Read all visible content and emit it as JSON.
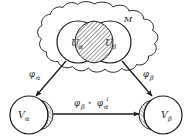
{
  "figure": {
    "background_color": "#ffffff",
    "stroke_color": "#1a1a1a",
    "hatch_color": "#555555"
  },
  "manifold": {
    "label": "M",
    "shape": "cloud"
  },
  "charts": {
    "u_alpha": {
      "label": "U",
      "subscript": "α"
    },
    "u_beta": {
      "label": "U",
      "subscript": "β"
    },
    "intersection": {
      "name": "u-alpha-beta-overlap",
      "fill": "hatched"
    }
  },
  "images": {
    "v_alpha": {
      "label": "V",
      "subscript": "α"
    },
    "v_beta": {
      "label": "V",
      "subscript": "β"
    }
  },
  "maps": {
    "phi_alpha": {
      "symbol": "φ",
      "subscript": "α"
    },
    "phi_beta": {
      "symbol": "φ",
      "subscript": "β"
    },
    "transition": {
      "first_symbol": "φ",
      "first_subscript": "β",
      "compose": "∘",
      "second_symbol": "φ",
      "second_subscript": "α",
      "second_superscript": "-1"
    }
  }
}
